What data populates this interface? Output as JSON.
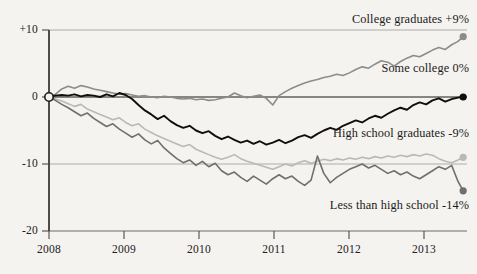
{
  "chart_data": {
    "type": "line",
    "title": "",
    "subtitle": "",
    "xlabel": "",
    "ylabel": "",
    "xlim": [
      2008.0,
      2013.45
    ],
    "ylim": [
      -20,
      10
    ],
    "grid": true,
    "legend_position": "inline-right-annotations",
    "zero_line": true,
    "origin_marker": "open-circle",
    "yticks": [
      "+10",
      "0",
      "-10",
      "-20"
    ],
    "ytick_values": [
      10,
      0,
      -10,
      -20
    ],
    "xticks": [
      "2008",
      "2009",
      "2010",
      "2011",
      "2012",
      "2013"
    ],
    "xtick_values": [
      2008,
      2009,
      2010,
      2011,
      2012,
      2013
    ],
    "series": [
      {
        "name": "College graduates",
        "end_label": "College graduates +9%",
        "end_value": 9,
        "color": "#8c8c8c",
        "endpoint_marker": true,
        "x": [
          2008.0,
          2008.083,
          2008.167,
          2008.25,
          2008.333,
          2008.417,
          2008.5,
          2008.583,
          2008.667,
          2008.75,
          2008.833,
          2008.917,
          2009.0,
          2009.083,
          2009.167,
          2009.25,
          2009.333,
          2009.417,
          2009.5,
          2009.583,
          2009.667,
          2009.75,
          2009.833,
          2009.917,
          2010.0,
          2010.083,
          2010.167,
          2010.25,
          2010.333,
          2010.417,
          2010.5,
          2010.583,
          2010.667,
          2010.75,
          2010.833,
          2010.917,
          2011.0,
          2011.083,
          2011.167,
          2011.25,
          2011.333,
          2011.417,
          2011.5,
          2011.583,
          2011.667,
          2011.75,
          2011.833,
          2011.917,
          2012.0,
          2012.083,
          2012.167,
          2012.25,
          2012.333,
          2012.417,
          2012.5,
          2012.583,
          2012.667,
          2012.75,
          2012.833,
          2012.917,
          2013.0,
          2013.083,
          2013.167,
          2013.25,
          2013.333,
          2013.4
        ],
        "values": [
          0,
          0.4,
          1.2,
          1.6,
          1.3,
          1.7,
          1.5,
          1.2,
          1.0,
          0.8,
          0.6,
          0.4,
          0.5,
          0.3,
          0.1,
          0.2,
          0.0,
          -0.1,
          0.1,
          0.0,
          -0.2,
          -0.3,
          -0.2,
          -0.4,
          -0.3,
          -0.5,
          -0.4,
          -0.2,
          0.0,
          0.6,
          0.2,
          -0.1,
          0.1,
          0.3,
          -0.2,
          -1.2,
          0.2,
          0.8,
          1.3,
          1.7,
          2.1,
          2.4,
          2.6,
          2.9,
          3.1,
          3.4,
          3.2,
          3.6,
          4.1,
          4.5,
          4.3,
          4.9,
          5.4,
          5.2,
          4.6,
          5.3,
          5.8,
          6.2,
          6.0,
          6.5,
          7.0,
          7.4,
          7.1,
          7.8,
          8.3,
          9.0
        ]
      },
      {
        "name": "Some college",
        "end_label": "Some college 0%",
        "end_value": 0,
        "color": "#100f0e",
        "endpoint_marker": true,
        "x": [
          2008.0,
          2008.083,
          2008.167,
          2008.25,
          2008.333,
          2008.417,
          2008.5,
          2008.583,
          2008.667,
          2008.75,
          2008.833,
          2008.917,
          2009.0,
          2009.083,
          2009.167,
          2009.25,
          2009.333,
          2009.417,
          2009.5,
          2009.583,
          2009.667,
          2009.75,
          2009.833,
          2009.917,
          2010.0,
          2010.083,
          2010.167,
          2010.25,
          2010.333,
          2010.417,
          2010.5,
          2010.583,
          2010.667,
          2010.75,
          2010.833,
          2010.917,
          2011.0,
          2011.083,
          2011.167,
          2011.25,
          2011.333,
          2011.417,
          2011.5,
          2011.583,
          2011.667,
          2011.75,
          2011.833,
          2011.917,
          2012.0,
          2012.083,
          2012.167,
          2012.25,
          2012.333,
          2012.417,
          2012.5,
          2012.583,
          2012.667,
          2012.75,
          2012.833,
          2012.917,
          2013.0,
          2013.083,
          2013.167,
          2013.25,
          2013.333,
          2013.4
        ],
        "values": [
          0,
          0.2,
          0.3,
          0.2,
          0.4,
          0.1,
          0.3,
          0.2,
          0.0,
          0.4,
          0.1,
          0.6,
          0.3,
          -0.3,
          -1.2,
          -2.0,
          -2.6,
          -3.3,
          -2.8,
          -3.6,
          -4.2,
          -4.6,
          -4.3,
          -5.0,
          -5.4,
          -5.1,
          -5.8,
          -6.3,
          -5.9,
          -6.4,
          -6.8,
          -6.5,
          -7.0,
          -6.6,
          -7.1,
          -6.8,
          -6.4,
          -6.9,
          -6.5,
          -6.0,
          -5.7,
          -6.1,
          -5.5,
          -5.0,
          -4.6,
          -4.9,
          -4.3,
          -3.9,
          -3.5,
          -3.8,
          -3.2,
          -2.8,
          -3.1,
          -2.5,
          -2.0,
          -1.6,
          -1.9,
          -1.2,
          -0.8,
          -1.1,
          -0.5,
          -0.2,
          -0.7,
          -0.3,
          -0.1,
          0.0
        ]
      },
      {
        "name": "High school graduates",
        "end_label": "High school graduates -9%",
        "end_value": -9,
        "color": "#b9b9b7",
        "endpoint_marker": true,
        "x": [
          2008.0,
          2008.083,
          2008.167,
          2008.25,
          2008.333,
          2008.417,
          2008.5,
          2008.583,
          2008.667,
          2008.75,
          2008.833,
          2008.917,
          2009.0,
          2009.083,
          2009.167,
          2009.25,
          2009.333,
          2009.417,
          2009.5,
          2009.583,
          2009.667,
          2009.75,
          2009.833,
          2009.917,
          2010.0,
          2010.083,
          2010.167,
          2010.25,
          2010.333,
          2010.417,
          2010.5,
          2010.583,
          2010.667,
          2010.75,
          2010.833,
          2010.917,
          2011.0,
          2011.083,
          2011.167,
          2011.25,
          2011.333,
          2011.417,
          2011.5,
          2011.583,
          2011.667,
          2011.75,
          2011.833,
          2011.917,
          2012.0,
          2012.083,
          2012.167,
          2012.25,
          2012.333,
          2012.417,
          2012.5,
          2012.583,
          2012.667,
          2012.75,
          2012.833,
          2012.917,
          2013.0,
          2013.083,
          2013.167,
          2013.25,
          2013.333,
          2013.4
        ],
        "values": [
          0,
          -0.3,
          -0.6,
          -1.0,
          -1.4,
          -1.1,
          -1.8,
          -2.2,
          -2.6,
          -3.0,
          -3.4,
          -3.1,
          -3.8,
          -4.3,
          -4.0,
          -4.8,
          -5.3,
          -5.8,
          -6.2,
          -6.6,
          -7.0,
          -7.4,
          -7.1,
          -7.8,
          -8.2,
          -8.6,
          -9.0,
          -9.3,
          -9.0,
          -8.6,
          -9.2,
          -9.6,
          -9.9,
          -10.2,
          -10.5,
          -10.8,
          -10.4,
          -10.0,
          -10.3,
          -9.8,
          -9.5,
          -9.9,
          -9.6,
          -9.3,
          -9.5,
          -9.2,
          -9.4,
          -9.1,
          -9.3,
          -9.0,
          -9.2,
          -8.9,
          -9.1,
          -8.8,
          -9.0,
          -8.7,
          -8.9,
          -8.6,
          -8.8,
          -8.5,
          -8.7,
          -9.2,
          -9.6,
          -9.8,
          -9.4,
          -9.0
        ]
      },
      {
        "name": "Less than high school",
        "end_label": "Less than high school -14%",
        "end_value": -14,
        "color": "#6f6f6e",
        "endpoint_marker": true,
        "x": [
          2008.0,
          2008.083,
          2008.167,
          2008.25,
          2008.333,
          2008.417,
          2008.5,
          2008.583,
          2008.667,
          2008.75,
          2008.833,
          2008.917,
          2009.0,
          2009.083,
          2009.167,
          2009.25,
          2009.333,
          2009.417,
          2009.5,
          2009.583,
          2009.667,
          2009.75,
          2009.833,
          2009.917,
          2010.0,
          2010.083,
          2010.167,
          2010.25,
          2010.333,
          2010.417,
          2010.5,
          2010.583,
          2010.667,
          2010.75,
          2010.833,
          2010.917,
          2011.0,
          2011.083,
          2011.167,
          2011.25,
          2011.333,
          2011.417,
          2011.5,
          2011.583,
          2011.667,
          2011.75,
          2011.833,
          2011.917,
          2012.0,
          2012.083,
          2012.167,
          2012.25,
          2012.333,
          2012.417,
          2012.5,
          2012.583,
          2012.667,
          2012.75,
          2012.833,
          2012.917,
          2013.0,
          2013.083,
          2013.167,
          2013.25,
          2013.333,
          2013.4
        ],
        "values": [
          0,
          -0.5,
          -1.1,
          -1.6,
          -2.2,
          -2.8,
          -2.4,
          -3.2,
          -3.8,
          -4.4,
          -4.0,
          -4.8,
          -5.4,
          -6.0,
          -5.5,
          -6.4,
          -7.0,
          -6.5,
          -7.6,
          -8.4,
          -9.2,
          -9.8,
          -9.4,
          -10.2,
          -9.6,
          -10.4,
          -9.9,
          -11.0,
          -11.6,
          -11.2,
          -12.0,
          -12.6,
          -11.8,
          -12.4,
          -13.0,
          -12.2,
          -11.6,
          -12.2,
          -11.8,
          -12.6,
          -13.2,
          -12.4,
          -8.8,
          -11.4,
          -12.8,
          -12.0,
          -11.4,
          -10.8,
          -10.4,
          -10.0,
          -10.6,
          -10.2,
          -10.8,
          -11.4,
          -11.0,
          -11.6,
          -11.2,
          -11.8,
          -12.2,
          -11.6,
          -11.0,
          -10.4,
          -10.8,
          -10.2,
          -12.6,
          -14.0
        ]
      }
    ]
  }
}
